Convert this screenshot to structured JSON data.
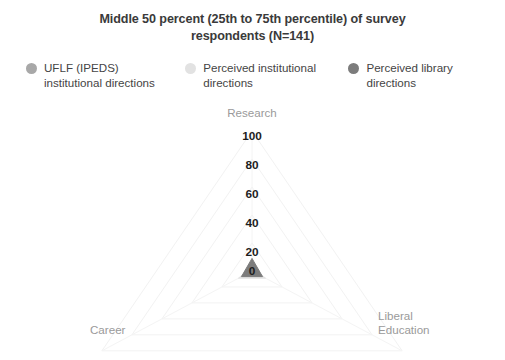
{
  "title": {
    "line1": "Middle 50 percent (25th to 75th percentile) of survey",
    "line2": "respondents (N=141)"
  },
  "legend": {
    "items": [
      {
        "label": "UFLF (IPEDS)\ninstitutional directions",
        "color": "#a8a8a8",
        "icon": "legend-dot-icon"
      },
      {
        "label": "Perceived institutional\ndirections",
        "color": "#e2e2e2",
        "icon": "legend-dot-icon"
      },
      {
        "label": "Perceived library\ndirections",
        "color": "#7c7c7c",
        "icon": "legend-dot-icon"
      }
    ]
  },
  "chart_data": {
    "type": "radar",
    "title": "Middle 50 percent (25th to 75th percentile) of survey respondents (N=141)",
    "categories": [
      "Research",
      "Liberal Education",
      "Career"
    ],
    "tick_labels": [
      "100",
      "80",
      "60",
      "40",
      "20",
      "0"
    ],
    "rlim": [
      0,
      100
    ],
    "rtick_values": [
      100,
      80,
      60,
      40,
      20,
      0
    ],
    "grid": true,
    "legend_position": "top",
    "series": [
      {
        "name": "UFLF (IPEDS) institutional directions",
        "color": "#a8a8a8",
        "values": [
          6,
          4,
          4
        ]
      },
      {
        "name": "Perceived institutional directions",
        "color": "#e2e2e2",
        "values": [
          3,
          9,
          9
        ]
      },
      {
        "name": "Perceived library directions",
        "color": "#7c7c7c",
        "values": [
          9,
          7,
          7
        ]
      }
    ],
    "axis_label_colors": "#9a9a9a",
    "tick_label_color": "#1d1d1d"
  },
  "axes": {
    "research": "Research",
    "career": "Career",
    "liberal_education": "Liberal\nEducation"
  }
}
